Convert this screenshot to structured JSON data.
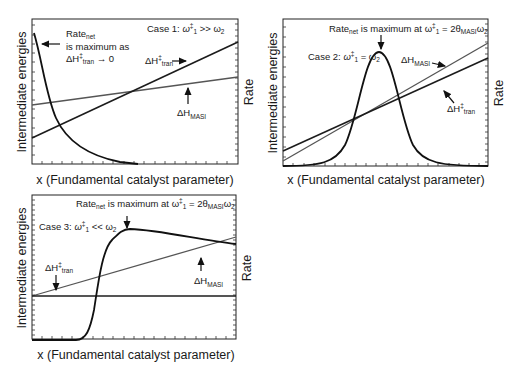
{
  "panels": [
    {
      "id": "case1",
      "case_label": {
        "prefix": "Case 1: ",
        "omega": "ω",
        "dagger": "‡",
        "sub1": "1",
        "relation": " >> ω",
        "sub2": "2"
      },
      "y_left_label": "Intermediate energies",
      "y_right_label": "Rate",
      "x_label": "x (Fundamental catalyst parameter)",
      "annotation_rate": {
        "line1": "Rate",
        "line1_sub": "net",
        "line2": "is maximum as",
        "line3_pre": "ΔH",
        "line3_sup": "‡",
        "line3_sub": "tran",
        "line3_post": " → 0"
      },
      "label_tran": {
        "pre": "ΔH",
        "sup": "‡",
        "sub": "tran"
      },
      "label_masi": {
        "pre": "ΔH",
        "sub": "MASI"
      }
    },
    {
      "id": "case2",
      "case_label": {
        "prefix": "Case 2: ",
        "omega": "ω",
        "dagger": "‡",
        "sub1": "1",
        "relation": " = ω",
        "sub2": "2"
      },
      "y_left_label": "Intermediate energies",
      "y_right_label": "Rate",
      "x_label": "x (Fundamental catalyst parameter)",
      "annotation_rate": {
        "pre": "Rate",
        "sub": "net",
        "post": " is maximum at  ω",
        "sup": "‡",
        "sub1": "1",
        "eq": " = 2θ",
        "sub_masi": "MASI",
        "tail": "ω",
        "sub2": "2"
      },
      "label_tran": {
        "pre": "ΔH",
        "sup": "‡",
        "sub": "tran"
      },
      "label_masi": {
        "pre": "ΔH",
        "sub": "MASI"
      }
    },
    {
      "id": "case3",
      "case_label": {
        "prefix": "Case 3: ",
        "omega": "ω",
        "dagger": "‡",
        "sub1": "1",
        "relation": " << ω",
        "sub2": "2"
      },
      "y_left_label": "Intermediate energies",
      "y_right_label": "Rate",
      "x_label": "x (Fundamental catalyst parameter)",
      "annotation_rate": {
        "pre": "Rate",
        "sub": "net",
        "post": " is maximum at ω",
        "sup": "‡",
        "sub1": "1",
        "eq": " = 2θ",
        "sub_masi": "MASI",
        "tail": "ω",
        "sub2": "2"
      },
      "label_tran": {
        "pre": "ΔH",
        "sup": "‡",
        "sub": "tran"
      },
      "label_masi": {
        "pre": "ΔH",
        "sub": "MASI"
      }
    }
  ],
  "colors": {
    "rate_curve": "#111111",
    "tran_line": "#1c1c1c",
    "masi_line": "#555555",
    "frame": "#222222"
  }
}
